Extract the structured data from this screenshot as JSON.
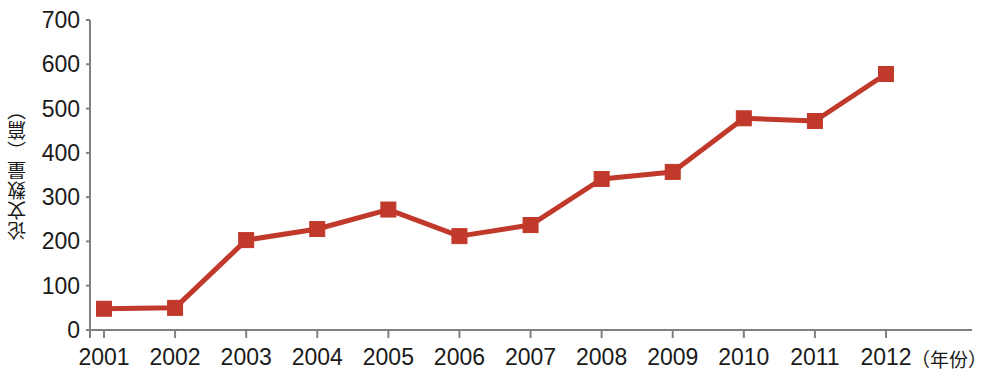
{
  "chart_data": {
    "type": "line",
    "title": "",
    "subtitle": "",
    "xlabel": "（年份）",
    "ylabel": "论文数量（篇）",
    "categories": [
      "2001",
      "2002",
      "2003",
      "2004",
      "2005",
      "2006",
      "2007",
      "2008",
      "2009",
      "2010",
      "2011",
      "2012"
    ],
    "values": [
      48,
      50,
      203,
      228,
      272,
      212,
      237,
      341,
      357,
      478,
      472,
      578
    ],
    "series": [
      {
        "name": "论文数量",
        "values": [
          48,
          50,
          203,
          228,
          272,
          212,
          237,
          341,
          357,
          478,
          472,
          578
        ]
      }
    ],
    "ylim": [
      0,
      700
    ],
    "yticks": [
      0,
      100,
      200,
      300,
      400,
      500,
      600,
      700
    ],
    "ytick_labels": [
      "0",
      "100",
      "200",
      "300",
      "400",
      "500",
      "600",
      "700"
    ],
    "grid": false,
    "legend": "none",
    "marker": "square",
    "series_color": "#C0392B",
    "line_color": "#C0392B",
    "axis_color": "#808080",
    "text_color": "#1a1a1a"
  }
}
